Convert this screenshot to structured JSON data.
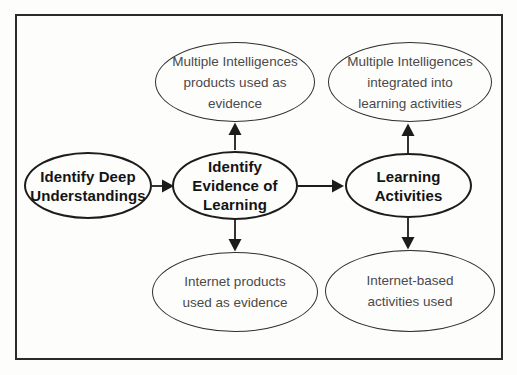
{
  "diagram": {
    "type": "flowchart",
    "colors": {
      "frame_border": "#2b2b2b",
      "node_border": "#1c1c1c",
      "arrow": "#1c1c1c",
      "bold_text": "#141414",
      "regular_text": "#4a4a4a",
      "background": "#fdfdfc"
    },
    "nodes": [
      {
        "id": "identify-deep-understandings",
        "style": "bold",
        "lines": [
          "Identify Deep",
          "Understandings"
        ]
      },
      {
        "id": "identify-evidence-of-learning",
        "style": "bold",
        "lines": [
          "Identify",
          "Evidence of",
          "Learning"
        ]
      },
      {
        "id": "learning-activities",
        "style": "bold",
        "lines": [
          "Learning",
          "Activities"
        ]
      },
      {
        "id": "multiple-intelligences-products",
        "style": "regular",
        "lines": [
          "Multiple Intelligences",
          "products used as",
          "evidence"
        ]
      },
      {
        "id": "multiple-intelligences-integrated",
        "style": "regular",
        "lines": [
          "Multiple Intelligences",
          "integrated into",
          "learning activities"
        ]
      },
      {
        "id": "internet-products",
        "style": "regular",
        "lines": [
          "Internet products",
          "used as evidence"
        ]
      },
      {
        "id": "internet-based-activities",
        "style": "regular",
        "lines": [
          "Internet-based",
          "activities used"
        ]
      }
    ],
    "edges": [
      {
        "from": "identify-deep-understandings",
        "to": "identify-evidence-of-learning",
        "direction": "right"
      },
      {
        "from": "identify-evidence-of-learning",
        "to": "multiple-intelligences-products",
        "direction": "up"
      },
      {
        "from": "identify-evidence-of-learning",
        "to": "internet-products",
        "direction": "down"
      },
      {
        "from": "identify-evidence-of-learning",
        "to": "learning-activities",
        "direction": "right"
      },
      {
        "from": "learning-activities",
        "to": "multiple-intelligences-integrated",
        "direction": "up"
      },
      {
        "from": "learning-activities",
        "to": "internet-based-activities",
        "direction": "down"
      }
    ]
  }
}
